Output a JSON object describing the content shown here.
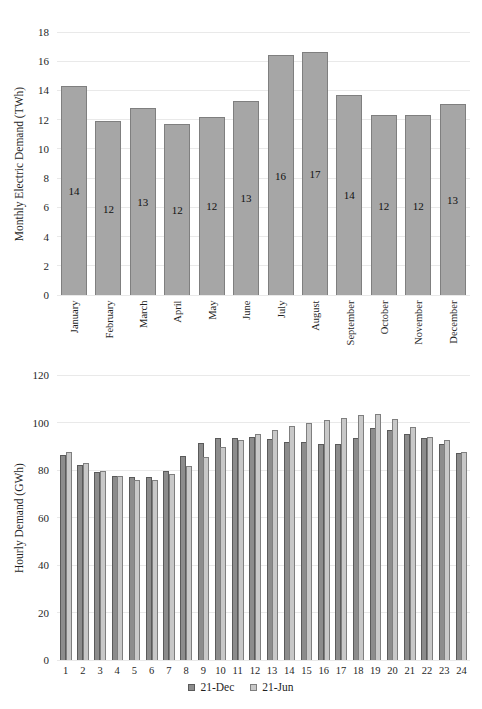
{
  "colors": {
    "background": "#ffffff",
    "grid": "#e9e9e9",
    "text": "#1f1f1f",
    "bar_value_label": "#111111"
  },
  "chart_data": [
    {
      "type": "bar",
      "title": "",
      "ylabel": "Monthly Electric Demand (TWh)",
      "xlabel": "",
      "categories": [
        "January",
        "February",
        "March",
        "April",
        "May",
        "June",
        "July",
        "August",
        "September",
        "October",
        "November",
        "December"
      ],
      "values": [
        14.3,
        11.9,
        12.8,
        11.7,
        12.2,
        13.3,
        16.4,
        16.6,
        13.7,
        12.3,
        12.3,
        13.1
      ],
      "bar_labels": [
        "14",
        "12",
        "13",
        "12",
        "12",
        "13",
        "16",
        "17",
        "14",
        "12",
        "12",
        "13"
      ],
      "ylim": [
        0,
        18
      ],
      "ytick_step": 2,
      "grid": true,
      "bar_fill": "#a6a6a6",
      "bar_border": "#7f7f7f",
      "xtick_rotation": 90,
      "legend_position": "none"
    },
    {
      "type": "bar",
      "title": "",
      "ylabel": "Hourly Demand (GWh)",
      "xlabel": "",
      "categories": [
        "1",
        "2",
        "3",
        "4",
        "5",
        "6",
        "7",
        "8",
        "9",
        "10",
        "11",
        "12",
        "13",
        "14",
        "15",
        "16",
        "17",
        "18",
        "19",
        "20",
        "21",
        "22",
        "23",
        "24"
      ],
      "series": [
        {
          "name": "21-Dec",
          "fill": "#8c8c8c",
          "border": "#5a5a5a",
          "values": [
            86.5,
            82,
            79,
            77.5,
            77,
            77,
            79.5,
            86,
            91.5,
            93.5,
            93.5,
            94,
            93,
            92,
            92,
            91,
            91,
            93.5,
            97.5,
            97,
            95,
            93.5,
            91,
            87
          ]
        },
        {
          "name": "21-Jun",
          "fill": "#c8c8c8",
          "border": "#7f7f7f",
          "values": [
            87.5,
            83,
            79.5,
            77.5,
            76,
            76,
            78.5,
            81.5,
            85.5,
            89.5,
            92.5,
            95,
            97,
            98.5,
            100,
            101,
            102,
            103,
            103.5,
            101.5,
            98,
            94,
            92.5,
            87.5
          ]
        }
      ],
      "ylim": [
        0,
        120
      ],
      "ytick_step": 20,
      "grid": true,
      "legend_position": "bottom"
    }
  ]
}
